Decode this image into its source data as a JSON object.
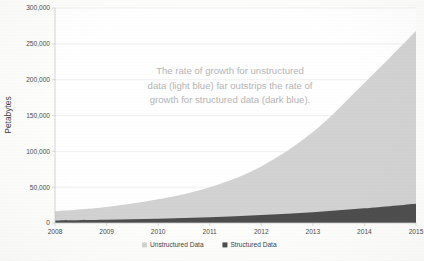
{
  "chart_data": {
    "type": "area",
    "stacked": true,
    "title": "",
    "subtitle": "",
    "xlabel": "",
    "ylabel": "Petabytes",
    "categories": [
      "2008",
      "2009",
      "2010",
      "2011",
      "2012",
      "2013",
      "2014",
      "2015"
    ],
    "x": [
      2008,
      2009,
      2010,
      2011,
      2012,
      2013,
      2014,
      2015
    ],
    "xlim": [
      2008,
      2015
    ],
    "ylim": [
      0,
      300000
    ],
    "ytick_labels": [
      "0",
      "50,000",
      "100,000",
      "150,000",
      "200,000",
      "250,000",
      "300,000"
    ],
    "ytick_values": [
      0,
      50000,
      100000,
      150000,
      200000,
      250000,
      300000
    ],
    "xtick_labels": [
      "2008",
      "2009",
      "2010",
      "2011",
      "2012",
      "2013",
      "2014",
      "2015"
    ],
    "grid": true,
    "grid_axis": "y",
    "legend_position": "bottom",
    "series": [
      {
        "name": "Unstructured Data",
        "color": "#d2d2d2",
        "values": [
          13000,
          18000,
          27000,
          42000,
          68000,
          112000,
          175000,
          241000
        ]
      },
      {
        "name": "Structured Data",
        "color": "#4d4d4d",
        "values": [
          3500,
          4500,
          6000,
          8000,
          11000,
          15000,
          20500,
          27000
        ]
      }
    ],
    "totals": [
      16500,
      22500,
      33000,
      50000,
      79000,
      127000,
      195500,
      268000
    ],
    "annotations": [
      {
        "id": "growth-note",
        "lines": [
          "The rate of growth for unstructured",
          "data (light blue) far outstrips the rate of",
          "growth for structured data (dark blue)."
        ],
        "color": "#b4b4b4"
      }
    ]
  },
  "legend": {
    "items": [
      {
        "label": "Unstructured Data",
        "marker_color": "#d2d2d2"
      },
      {
        "label": "Structured Data",
        "marker_color": "#4d4d4d"
      }
    ]
  },
  "axes": {
    "y_title": "Petabytes"
  }
}
